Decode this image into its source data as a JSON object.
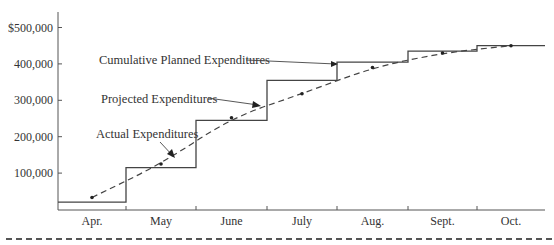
{
  "chart_data": {
    "type": "line",
    "title": "",
    "xlabel": "",
    "ylabel": "",
    "categories": [
      "Apr.",
      "May",
      "June",
      "July",
      "Aug.",
      "Sept.",
      "Oct."
    ],
    "yticks": [
      {
        "value": 100000,
        "label": "100,000"
      },
      {
        "value": 200000,
        "label": "200,000"
      },
      {
        "value": 300000,
        "label": "300,000"
      },
      {
        "value": 400000,
        "label": "400,000"
      },
      {
        "value": 500000,
        "label": "$500,000"
      }
    ],
    "ylim": [
      0,
      500000
    ],
    "grid": false,
    "series": [
      {
        "name": "Cumulative Planned Expenditures",
        "style": "step-solid",
        "values": [
          20000,
          115000,
          245000,
          355000,
          405000,
          435000,
          450000
        ]
      },
      {
        "name": "Actual / Projected Expenditures",
        "style": "dashed-with-dots",
        "values": [
          33000,
          125000,
          252000,
          318000,
          390000,
          430000,
          450000
        ]
      }
    ],
    "annotations": [
      {
        "text": "Cumulative Planned Expenditures",
        "points_to": "planned step at July/Aug boundary"
      },
      {
        "text": "Projected Expenditures",
        "points_to": "dashed curve near late June"
      },
      {
        "text": "Actual Expenditures",
        "points_to": "dashed curve in May"
      }
    ]
  },
  "labels": {
    "planned": "Cumulative Planned Expenditures",
    "projected": "Projected Expenditures",
    "actual": "Actual Expenditures"
  }
}
